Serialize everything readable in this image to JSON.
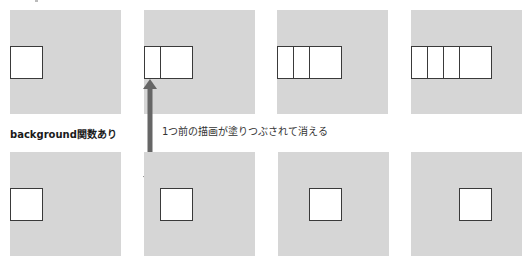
{
  "diagram": {
    "section_label": "background関数あり",
    "annotation": "1つ前の描画が塗りつぶされて消える",
    "colors": {
      "panel_fill": "#d6d6d6",
      "rect_fill": "#ffffff",
      "rect_stroke": "#3a3a3a",
      "arrow": "#666666"
    },
    "top_row": {
      "description": "background関数なし",
      "frames": [
        {
          "frame": 1,
          "visible_rect_count": 1
        },
        {
          "frame": 2,
          "visible_rect_count": 2
        },
        {
          "frame": 3,
          "visible_rect_count": 3
        },
        {
          "frame": 4,
          "visible_rect_count": 4
        }
      ]
    },
    "bottom_row": {
      "frames": [
        {
          "frame": 1,
          "visible_rect_count": 1
        },
        {
          "frame": 2,
          "visible_rect_count": 1
        },
        {
          "frame": 3,
          "visible_rect_count": 1
        },
        {
          "frame": 4,
          "visible_rect_count": 1
        }
      ]
    }
  }
}
